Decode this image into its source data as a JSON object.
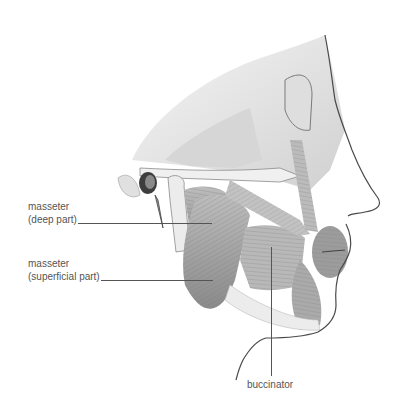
{
  "figure": {
    "labels": {
      "masseter_deep": {
        "line1": "masseter",
        "line2": "(deep part)"
      },
      "masseter_superficial": {
        "line1": "masseter",
        "line2": "(superficial part)"
      },
      "buccinator": {
        "text": "buccinator"
      }
    },
    "colors": {
      "background": "#ffffff",
      "label_text": "#555555",
      "leader_line": "#555555",
      "bone": "#e6e6e6",
      "bone_shade": "#b5b5b5",
      "muscle": "#a9a9a9",
      "muscle_dark": "#6f6f6f",
      "outline": "#4a4a4a"
    }
  }
}
